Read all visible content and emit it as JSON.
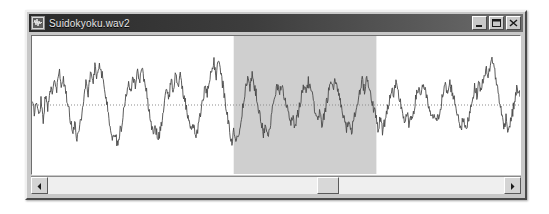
{
  "window": {
    "title": "Suidokyoku.wav2",
    "app_icon": "waveform-app-icon",
    "controls": {
      "minimize_label": "_",
      "maximize_label": "□",
      "close_label": "×"
    }
  },
  "waveform": {
    "center_line": "dotted-zero-line",
    "trace_color": "#4a4a4a",
    "background_color": "#ffffff",
    "selection": {
      "label": "selected-region",
      "fill_color": "#cfcfcf",
      "start_fraction": 0.41,
      "end_fraction": 0.7
    }
  },
  "scrollbar": {
    "left_arrow": "◀",
    "right_arrow": "▶",
    "thumb_position_fraction": 0.59,
    "track_color": "#efefef"
  },
  "chart_data": {
    "type": "line",
    "title": "Suidokyoku.wav2",
    "xlabel": "",
    "ylabel": "",
    "ylim": [
      -1,
      1
    ],
    "grid": false,
    "legend": "none",
    "series": [
      {
        "name": "audio-amplitude",
        "values": [
          0.02,
          -0.1,
          0.05,
          -0.18,
          0.08,
          -0.22,
          0.14,
          -0.05,
          0.3,
          0.12,
          0.42,
          0.2,
          0.55,
          0.3,
          0.4,
          0.18,
          0.05,
          -0.2,
          -0.42,
          -0.3,
          -0.52,
          -0.35,
          -0.18,
          0.1,
          0.35,
          0.2,
          0.5,
          0.32,
          0.62,
          0.44,
          0.7,
          0.5,
          0.35,
          0.1,
          -0.15,
          -0.38,
          -0.55,
          -0.4,
          -0.62,
          -0.45,
          -0.3,
          -0.05,
          0.2,
          0.38,
          0.25,
          0.48,
          0.3,
          0.55,
          0.36,
          0.62,
          0.4,
          0.2,
          -0.05,
          -0.28,
          -0.48,
          -0.32,
          -0.58,
          -0.4,
          -0.22,
          0.02,
          0.26,
          0.14,
          0.4,
          0.22,
          0.52,
          0.34,
          0.44,
          0.24,
          0.1,
          -0.12,
          -0.3,
          -0.45,
          -0.28,
          -0.5,
          -0.34,
          -0.14,
          0.08,
          0.28,
          0.16,
          0.38,
          0.52,
          0.68,
          0.46,
          0.72,
          0.5,
          0.3,
          0.08,
          -0.18,
          -0.4,
          -0.58,
          -0.38,
          -0.62,
          -0.42,
          -0.24,
          0.0,
          0.22,
          0.4,
          0.26,
          0.48,
          0.3,
          0.14,
          -0.08,
          -0.26,
          -0.44,
          -0.28,
          -0.5,
          -0.32,
          -0.1,
          0.12,
          0.3,
          0.18,
          0.34,
          0.2,
          0.06,
          -0.14,
          -0.3,
          -0.18,
          -0.34,
          -0.2,
          -0.04,
          0.16,
          0.32,
          0.2,
          0.38,
          0.24,
          0.1,
          -0.1,
          -0.26,
          -0.14,
          -0.3,
          -0.18,
          0.02,
          0.2,
          0.34,
          0.22,
          0.4,
          0.26,
          0.12,
          -0.06,
          -0.22,
          -0.38,
          -0.24,
          -0.44,
          -0.28,
          -0.12,
          0.06,
          0.24,
          0.38,
          0.24,
          0.44,
          0.3,
          0.14,
          -0.04,
          -0.2,
          -0.36,
          -0.22,
          -0.4,
          -0.26,
          -0.1,
          0.08,
          0.26,
          0.14,
          0.32,
          0.18,
          0.04,
          -0.12,
          -0.28,
          -0.16,
          -0.32,
          -0.2,
          -0.06,
          0.12,
          0.28,
          0.16,
          0.34,
          0.2,
          0.06,
          -0.1,
          -0.24,
          -0.12,
          -0.28,
          -0.16,
          0.0,
          0.18,
          0.3,
          0.18,
          0.34,
          0.22,
          0.08,
          -0.08,
          -0.22,
          -0.36,
          -0.22,
          -0.4,
          -0.26,
          -0.08,
          0.1,
          0.26,
          0.16,
          0.36,
          0.22,
          0.44,
          0.58,
          0.4,
          0.66,
          0.72,
          0.52,
          0.3,
          0.1,
          -0.14,
          -0.34,
          -0.2,
          -0.4,
          -0.26,
          -0.1,
          0.1,
          0.28,
          0.16,
          0.34,
          0.2
        ]
      }
    ]
  }
}
